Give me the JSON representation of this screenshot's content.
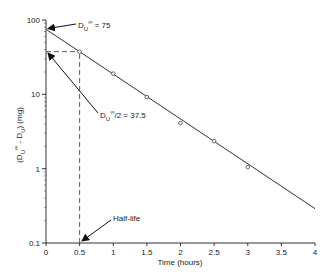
{
  "chart_data": {
    "type": "scatter",
    "title": "",
    "xlabel": "Time (hours)",
    "ylabel": "(D_U^∞ - D_U) (mg)",
    "ylabel_parts": {
      "open": "(D",
      "sub1": "U",
      "sup1": "∞",
      "mid": " - D",
      "sub2": "U",
      "close": ") (mg)"
    },
    "xlim": [
      0,
      4
    ],
    "ylim": [
      0.1,
      100
    ],
    "yscale": "log",
    "grid": false,
    "legend": null,
    "x_ticks": [
      "0",
      "0.5",
      "1",
      "1.5",
      "2",
      "2.5",
      "3",
      "3.5",
      "4"
    ],
    "x_tick_values": [
      0,
      0.5,
      1,
      1.5,
      2,
      2.5,
      3,
      3.5,
      4
    ],
    "y_ticks": [
      "0.1",
      "1",
      "10",
      "100"
    ],
    "y_tick_values": [
      0.1,
      1,
      10,
      100
    ],
    "series": [
      {
        "name": "observed",
        "marker": "open-circle",
        "x": [
          0.5,
          1.0,
          1.5,
          2.0,
          2.5,
          3.0
        ],
        "y": [
          37.5,
          19.0,
          9.2,
          4.1,
          2.35,
          1.05
        ]
      },
      {
        "name": "fitted line",
        "style": "line",
        "x": [
          0,
          4
        ],
        "y": [
          75,
          0.29
        ]
      }
    ],
    "reference_lines": [
      {
        "type": "horizontal-dashed",
        "y": 37.5,
        "x_from": 0,
        "x_to": 0.5
      },
      {
        "type": "vertical-dashed",
        "x": 0.5,
        "y_from": 0.1,
        "y_to": 37.5
      }
    ],
    "annotations": [
      {
        "id": "intercept",
        "parts": {
          "base": "D",
          "sub": "U",
          "sup": "∞",
          "rest": " = 75"
        },
        "points_to": {
          "x": 0,
          "y": 75
        }
      },
      {
        "id": "half",
        "parts": {
          "base": "D",
          "sub": "U",
          "sup": "∞",
          "rest": "/2 = 37.5"
        },
        "points_to": {
          "x": 0,
          "y": 37.5
        }
      },
      {
        "id": "halflife",
        "text": "Half-life",
        "points_to": {
          "x": 0.5,
          "y": 0.1
        }
      }
    ]
  }
}
